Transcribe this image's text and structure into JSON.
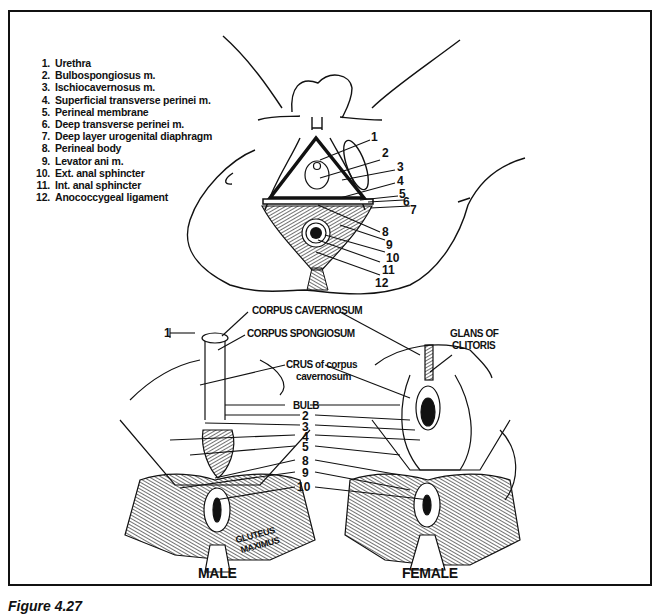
{
  "figure": {
    "caption": "Figure 4.27"
  },
  "top_diagram": {
    "legend": [
      {
        "num": "1.",
        "label": "Urethra"
      },
      {
        "num": "2.",
        "label": "Bulbospongiosus m."
      },
      {
        "num": "3.",
        "label": "Ischiocavernosus m."
      },
      {
        "num": "4.",
        "label": "Superficial transverse perinei m."
      },
      {
        "num": "5.",
        "label": "Perineal membrane"
      },
      {
        "num": "6.",
        "label": "Deep transverse perinei m."
      },
      {
        "num": "7.",
        "label": "Deep layer urogenital diaphragm"
      },
      {
        "num": "8.",
        "label": "Perineal body"
      },
      {
        "num": "9.",
        "label": "Levator ani m."
      },
      {
        "num": "10.",
        "label": "Ext. anal sphincter"
      },
      {
        "num": "11.",
        "label": "Int. anal sphincter"
      },
      {
        "num": "12.",
        "label": "Anococcygeal ligament"
      }
    ],
    "callouts": [
      "1",
      "2",
      "3",
      "4",
      "5",
      "6",
      "7",
      "8",
      "9",
      "10",
      "11",
      "12"
    ]
  },
  "bottom_diagram": {
    "labels": {
      "corpus_cavernosum": "CORPUS CAVERNOSUM",
      "corpus_spongiosum": "CORPUS SPONGIOSUM",
      "crus_line1": "CRUS of corpus",
      "crus_line2": "cavernosum",
      "glans_line1": "GLANS OF",
      "glans_line2": "CLITORIS",
      "bulb": "BULB",
      "gluteus_line1": "GLUTEUS",
      "gluteus_line2": "MAXIMUS",
      "male_one": "1"
    },
    "center_callouts": [
      "2",
      "3",
      "4",
      "5",
      "8",
      "9",
      "10"
    ],
    "male_title": "MALE",
    "female_title": "FEMALE"
  }
}
